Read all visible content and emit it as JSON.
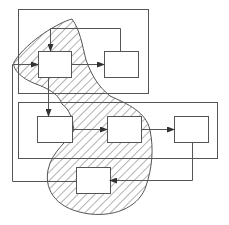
{
  "diagram": {
    "type": "block-diagram-with-hatched-region",
    "stroke_color": "#555555",
    "hatch_color": "#666666",
    "background": "#ffffff",
    "groups": [
      {
        "id": "top-group",
        "x": 18,
        "y": 9,
        "w": 130,
        "h": 84
      },
      {
        "id": "bottom-group",
        "x": 18,
        "y": 102,
        "w": 199,
        "h": 56
      }
    ],
    "blocks": [
      {
        "id": "A",
        "x": 38,
        "y": 51,
        "w": 33,
        "h": 26,
        "label": ""
      },
      {
        "id": "B",
        "x": 104,
        "y": 51,
        "w": 34,
        "h": 26,
        "label": ""
      },
      {
        "id": "C",
        "x": 37,
        "y": 116,
        "w": 35,
        "h": 26,
        "label": ""
      },
      {
        "id": "D",
        "x": 107,
        "y": 116,
        "w": 34,
        "h": 26,
        "label": ""
      },
      {
        "id": "E",
        "x": 174,
        "y": 116,
        "w": 34,
        "h": 26,
        "label": ""
      },
      {
        "id": "F",
        "x": 76,
        "y": 167,
        "w": 34,
        "h": 26,
        "label": ""
      }
    ],
    "connections": [
      {
        "from": "input",
        "to": "A",
        "arrow": true
      },
      {
        "from": "A",
        "to": "B",
        "arrow": true
      },
      {
        "from": "B",
        "to": "A",
        "via": "top-feedback",
        "arrow": true
      },
      {
        "from": "A",
        "to": "C",
        "arrow": true
      },
      {
        "from": "C",
        "to": "D",
        "arrow": true
      },
      {
        "from": "D",
        "to": "E",
        "arrow": true
      },
      {
        "from": "E",
        "to": "F",
        "arrow": true
      }
    ],
    "hatched_region": {
      "contains": [
        "A",
        "D",
        "F"
      ],
      "pattern": "diagonal-lines"
    }
  }
}
